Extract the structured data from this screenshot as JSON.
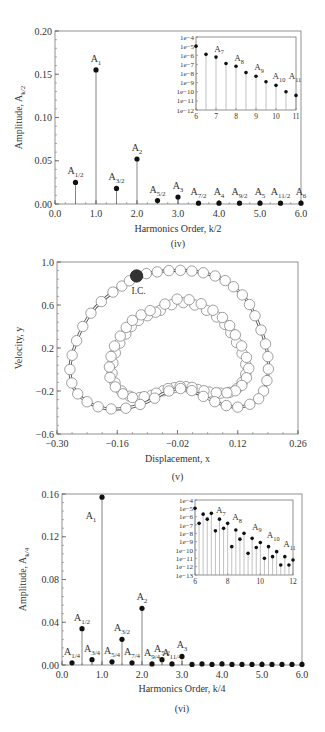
{
  "chart_data": [
    {
      "id": "iv",
      "type": "bar",
      "subtype": "stem",
      "caption": "(iv)",
      "xlabel": "Harmonics Order, k/2",
      "ylabel": "Amplitude, A",
      "ylabel_sub": "k/2",
      "xlim": [
        0,
        6
      ],
      "ylim": [
        0,
        0.2
      ],
      "xticks": [
        "0.0",
        "1.0",
        "2.0",
        "3.0",
        "4.0",
        "5.0",
        "6.0"
      ],
      "yticks": [
        "0.00",
        "0.05",
        "0.10",
        "0.15",
        "0.20"
      ],
      "points": [
        {
          "x": 0.5,
          "y": 0.025,
          "label": "A",
          "sub": "1/2"
        },
        {
          "x": 1.0,
          "y": 0.155,
          "label": "A",
          "sub": "1"
        },
        {
          "x": 1.5,
          "y": 0.018,
          "label": "A",
          "sub": "3/2"
        },
        {
          "x": 2.0,
          "y": 0.052,
          "label": "A",
          "sub": "2"
        },
        {
          "x": 2.5,
          "y": 0.004,
          "label": "A",
          "sub": "5/2"
        },
        {
          "x": 3.0,
          "y": 0.008,
          "label": "A",
          "sub": "3"
        },
        {
          "x": 3.5,
          "y": 0.001,
          "label": "A",
          "sub": "7/2"
        },
        {
          "x": 4.0,
          "y": 0.001,
          "label": "A",
          "sub": "4"
        },
        {
          "x": 4.5,
          "y": 0.001,
          "label": "A",
          "sub": "9/2"
        },
        {
          "x": 5.0,
          "y": 0.001,
          "label": "A",
          "sub": "5"
        },
        {
          "x": 5.5,
          "y": 0.001,
          "label": "A",
          "sub": "11/2"
        },
        {
          "x": 6.0,
          "y": 0.001,
          "label": "A",
          "sub": "6"
        }
      ],
      "inset": {
        "yscale": "log",
        "xlim": [
          6,
          11
        ],
        "ylim_exp": [
          -12,
          -4
        ],
        "xticks": [
          "6",
          "7",
          "8",
          "9",
          "10",
          "11"
        ],
        "yticks": [
          "1e-4",
          "1e-5",
          "1e-6",
          "1e-7",
          "1e-8",
          "1e-9",
          "1e-10",
          "1e-11",
          "1e-12"
        ],
        "points_exp": [
          {
            "x": 6.0,
            "e": -5.0
          },
          {
            "x": 6.5,
            "e": -5.9
          },
          {
            "x": 7.0,
            "e": -6.2
          },
          {
            "x": 7.5,
            "e": -6.9
          },
          {
            "x": 8.0,
            "e": -7.2
          },
          {
            "x": 8.5,
            "e": -7.9
          },
          {
            "x": 9.0,
            "e": -8.3
          },
          {
            "x": 9.5,
            "e": -8.9
          },
          {
            "x": 10.0,
            "e": -9.3
          },
          {
            "x": 10.5,
            "e": -10.0
          },
          {
            "x": 11.0,
            "e": -10.4
          }
        ],
        "labels": [
          {
            "x": 7.0,
            "e": -5.4,
            "label": "A",
            "sub": "7"
          },
          {
            "x": 8.0,
            "e": -6.4,
            "label": "A",
            "sub": "8"
          },
          {
            "x": 9.0,
            "e": -7.4,
            "label": "A",
            "sub": "9"
          },
          {
            "x": 10.0,
            "e": -8.4,
            "label": "A",
            "sub": "10"
          },
          {
            "x": 10.8,
            "e": -8.4,
            "label": "A",
            "sub": "11"
          }
        ]
      }
    },
    {
      "id": "v",
      "type": "scatter",
      "caption": "(v)",
      "xlabel": "Displacement, x",
      "ylabel": "Velocity, y",
      "xlim": [
        -0.3,
        0.26
      ],
      "ylim": [
        -0.6,
        1.0
      ],
      "xticks": [
        "-0.30",
        "-0.16",
        "-0.02",
        "0.12",
        "0.26"
      ],
      "yticks": [
        "-0.6",
        "-0.2",
        "0.2",
        "0.6",
        "1.0"
      ],
      "annotation": {
        "text": "I.C.",
        "x": -0.115,
        "y": 0.87
      },
      "initial_condition": {
        "x": -0.115,
        "y": 0.87
      },
      "outer_orbit": [
        [
          -0.115,
          0.87
        ],
        [
          -0.08,
          0.9
        ],
        [
          -0.04,
          0.92
        ],
        [
          0.0,
          0.92
        ],
        [
          0.04,
          0.9
        ],
        [
          0.08,
          0.85
        ],
        [
          0.11,
          0.77
        ],
        [
          0.14,
          0.65
        ],
        [
          0.16,
          0.5
        ],
        [
          0.18,
          0.3
        ],
        [
          0.19,
          0.12
        ],
        [
          0.19,
          -0.05
        ],
        [
          0.18,
          -0.2
        ],
        [
          0.16,
          -0.3
        ],
        [
          0.12,
          -0.35
        ],
        [
          0.08,
          -0.32
        ],
        [
          0.04,
          -0.25
        ],
        [
          0.0,
          -0.18
        ],
        [
          -0.04,
          -0.2
        ],
        [
          -0.09,
          -0.3
        ],
        [
          -0.14,
          -0.36
        ],
        [
          -0.19,
          -0.36
        ],
        [
          -0.23,
          -0.3
        ],
        [
          -0.26,
          -0.18
        ],
        [
          -0.27,
          0.0
        ],
        [
          -0.26,
          0.2
        ],
        [
          -0.24,
          0.4
        ],
        [
          -0.21,
          0.58
        ],
        [
          -0.17,
          0.72
        ],
        [
          -0.14,
          0.8
        ]
      ],
      "inner_orbit": [
        [
          -0.06,
          0.55
        ],
        [
          -0.02,
          0.62
        ],
        [
          0.02,
          0.6
        ],
        [
          0.06,
          0.52
        ],
        [
          0.09,
          0.42
        ],
        [
          0.11,
          0.3
        ],
        [
          0.13,
          0.15
        ],
        [
          0.14,
          0.0
        ],
        [
          0.13,
          -0.12
        ],
        [
          0.11,
          -0.2
        ],
        [
          0.08,
          -0.22
        ],
        [
          0.04,
          -0.2
        ],
        [
          0.0,
          -0.16
        ],
        [
          -0.04,
          -0.18
        ],
        [
          -0.08,
          -0.24
        ],
        [
          -0.12,
          -0.26
        ],
        [
          -0.15,
          -0.2
        ],
        [
          -0.17,
          -0.08
        ],
        [
          -0.17,
          0.06
        ],
        [
          -0.16,
          0.2
        ],
        [
          -0.14,
          0.33
        ],
        [
          -0.12,
          0.43
        ],
        [
          -0.09,
          0.5
        ]
      ]
    },
    {
      "id": "vi",
      "type": "bar",
      "subtype": "stem",
      "caption": "(vi)",
      "xlabel": "Harmonics Order, k/4",
      "ylabel": "Amplitude, A",
      "ylabel_sub": "k/4",
      "xlim": [
        0,
        6
      ],
      "ylim": [
        0,
        0.16
      ],
      "xticks": [
        "0.0",
        "1.0",
        "2.0",
        "3.0",
        "4.0",
        "5.0",
        "6.0"
      ],
      "yticks": [
        "0.00",
        "0.04",
        "0.08",
        "0.12",
        "0.16"
      ],
      "points": [
        {
          "x": 0.25,
          "y": 0.002,
          "label": "A",
          "sub": "1/4"
        },
        {
          "x": 0.5,
          "y": 0.034,
          "label": "A",
          "sub": "1/2"
        },
        {
          "x": 0.75,
          "y": 0.005,
          "label": "A",
          "sub": "3/4"
        },
        {
          "x": 1.0,
          "y": 0.157,
          "label": "A",
          "sub": "1"
        },
        {
          "x": 1.25,
          "y": 0.003,
          "label": "A",
          "sub": "5/4"
        },
        {
          "x": 1.5,
          "y": 0.024,
          "label": "A",
          "sub": "3/2"
        },
        {
          "x": 1.75,
          "y": 0.002,
          "label": "A",
          "sub": "7/4"
        },
        {
          "x": 2.0,
          "y": 0.053,
          "label": "A",
          "sub": "2"
        },
        {
          "x": 2.25,
          "y": 0.001,
          "label": "A",
          "sub": "9/4"
        },
        {
          "x": 2.5,
          "y": 0.005,
          "label": "A",
          "sub": "5/2"
        },
        {
          "x": 2.75,
          "y": 0.001,
          "label": "A",
          "sub": "11/4"
        },
        {
          "x": 3.0,
          "y": 0.008,
          "label": "A",
          "sub": "3"
        },
        {
          "x": 3.25,
          "y": 0.0005
        },
        {
          "x": 3.5,
          "y": 0.001
        },
        {
          "x": 3.75,
          "y": 0.0005
        },
        {
          "x": 4.0,
          "y": 0.001
        },
        {
          "x": 4.25,
          "y": 0.0005
        },
        {
          "x": 4.5,
          "y": 0.0005
        },
        {
          "x": 4.75,
          "y": 0.0005
        },
        {
          "x": 5.0,
          "y": 0.0005
        },
        {
          "x": 5.25,
          "y": 0.0005
        },
        {
          "x": 5.5,
          "y": 0.0005
        },
        {
          "x": 5.75,
          "y": 0.0005
        },
        {
          "x": 6.0,
          "y": 0.0005
        }
      ],
      "inset": {
        "yscale": "log",
        "xlim": [
          6,
          12
        ],
        "ylim_exp": [
          -13,
          -4
        ],
        "xticks": [
          "6",
          "8",
          "10",
          "12"
        ],
        "yticks": [
          "1e-4",
          "1e-5",
          "1e-6",
          "1e-7",
          "1e-8",
          "1e-9",
          "1e-10",
          "1e-11",
          "1e-12",
          "1e-13"
        ],
        "points_exp": [
          {
            "x": 6.0,
            "e": -5.0
          },
          {
            "x": 6.25,
            "e": -6.8
          },
          {
            "x": 6.5,
            "e": -5.7
          },
          {
            "x": 6.75,
            "e": -6.3
          },
          {
            "x": 7.0,
            "e": -5.6
          },
          {
            "x": 7.25,
            "e": -7.7
          },
          {
            "x": 7.5,
            "e": -6.3
          },
          {
            "x": 7.75,
            "e": -7.4
          },
          {
            "x": 8.0,
            "e": -6.8
          },
          {
            "x": 8.25,
            "e": -9.6
          },
          {
            "x": 8.5,
            "e": -7.6
          },
          {
            "x": 8.75,
            "e": -8.7
          },
          {
            "x": 9.0,
            "e": -8.0
          },
          {
            "x": 9.25,
            "e": -10.4
          },
          {
            "x": 9.5,
            "e": -8.6
          },
          {
            "x": 9.75,
            "e": -9.7
          },
          {
            "x": 10.0,
            "e": -9.1
          },
          {
            "x": 10.25,
            "e": -11.0
          },
          {
            "x": 10.5,
            "e": -9.6
          },
          {
            "x": 10.75,
            "e": -10.8
          },
          {
            "x": 11.0,
            "e": -10.2
          },
          {
            "x": 11.25,
            "e": -11.8
          },
          {
            "x": 11.5,
            "e": -10.8
          },
          {
            "x": 11.75,
            "e": -11.8
          },
          {
            "x": 12.0,
            "e": -11.2
          }
        ],
        "labels": [
          {
            "x": 7.4,
            "e": -5.3,
            "label": "A",
            "sub": "7"
          },
          {
            "x": 8.4,
            "e": -6.2,
            "label": "A",
            "sub": "8"
          },
          {
            "x": 9.6,
            "e": -7.3,
            "label": "A",
            "sub": "9"
          },
          {
            "x": 10.6,
            "e": -8.3,
            "label": "A",
            "sub": "10"
          },
          {
            "x": 11.6,
            "e": -9.4,
            "label": "A",
            "sub": "11"
          }
        ]
      }
    }
  ]
}
